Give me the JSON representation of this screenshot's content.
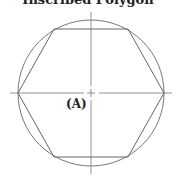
{
  "diagram": {
    "title": "Inscribed Polygon",
    "center_label": "(A)",
    "shape": "regular hexagon inscribed in circle",
    "colors": {
      "stroke": "#666666",
      "text": "#222222",
      "background": "#ffffff"
    }
  }
}
